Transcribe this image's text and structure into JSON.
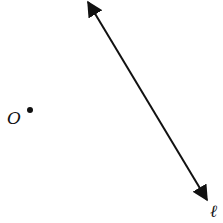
{
  "diagram": {
    "point": {
      "label": "O",
      "x": 30,
      "y": 110
    },
    "line": {
      "label": "ℓ",
      "x1": 88,
      "y1": 2,
      "x2": 207,
      "y2": 200
    },
    "colors": {
      "stroke": "#111111",
      "background": "#ffffff"
    }
  }
}
